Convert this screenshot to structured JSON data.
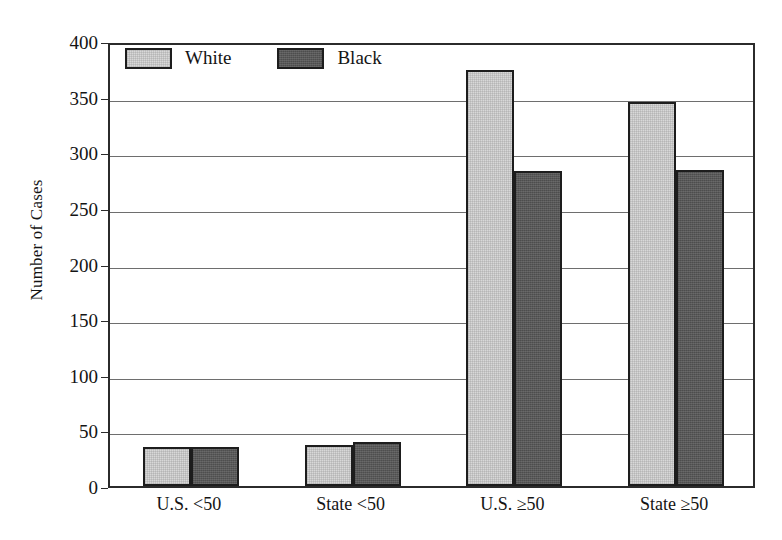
{
  "chart_data": {
    "type": "bar",
    "title": "",
    "subtitle": "",
    "xlabel": "",
    "ylabel": "Number of Cases",
    "categories": [
      "U.S. <50",
      "State <50",
      "U.S. ≥50",
      "State ≥50"
    ],
    "series": [
      {
        "name": "White",
        "color": "#d8d8d8",
        "values": [
          35,
          37,
          374,
          345
        ]
      },
      {
        "name": "Black",
        "color": "#585858",
        "values": [
          35,
          40,
          283,
          284
        ]
      }
    ],
    "ylim": [
      0,
      400
    ],
    "ytick_step": 50,
    "yticks": [
      0,
      50,
      100,
      150,
      200,
      250,
      300,
      350,
      400
    ],
    "ytick_labels": [
      "0",
      "50",
      "100",
      "150",
      "200",
      "250",
      "300",
      "350",
      "400"
    ],
    "grid": true,
    "grid_axis": "y",
    "legend_position": "inside-top-left",
    "frame": true,
    "bar_edge_color": "#1d1d1d"
  },
  "colors": {
    "series_white_fill": "#d8d8d8",
    "series_black_fill": "#585858",
    "axis": "#2b2b2b",
    "gridline": "#6e6e6e",
    "text": "#141414",
    "background": "#ffffff"
  }
}
